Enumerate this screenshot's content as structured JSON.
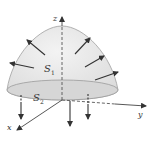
{
  "figure": {
    "labels": {
      "z_axis": "z",
      "y_axis": "y",
      "x_axis": "x",
      "surface_top": "S",
      "surface_top_sub": "1",
      "surface_bottom": "S",
      "surface_bottom_sub": "2"
    },
    "colors": {
      "surface_fill": "#e6e6e6",
      "surface_stroke": "#9a9a9a",
      "axis": "#444444",
      "arrow": "#333333",
      "base_fill": "#d4d4d4"
    }
  }
}
